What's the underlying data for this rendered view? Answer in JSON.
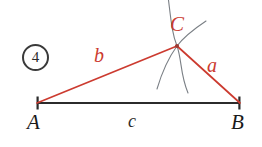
{
  "figure": {
    "badge": {
      "label": "4"
    },
    "vertices": [
      {
        "id": "A",
        "label": "A",
        "color": "#1a1a1a",
        "x": 37,
        "y": 103,
        "label_x": 27,
        "label_y": 112
      },
      {
        "id": "B",
        "label": "B",
        "color": "#1a1a1a",
        "x": 240,
        "y": 103,
        "label_x": 231,
        "label_y": 112
      },
      {
        "id": "C",
        "label": "C",
        "color": "#cc3b30",
        "x": 177,
        "y": 46,
        "label_x": 170,
        "label_y": 14
      }
    ],
    "sides": [
      {
        "id": "a",
        "label": "a",
        "from": "C",
        "to": "B",
        "color": "#cc3b30",
        "label_x": 207,
        "label_y": 55
      },
      {
        "id": "b",
        "label": "b",
        "from": "A",
        "to": "C",
        "color": "#cc3b30",
        "label_x": 94,
        "label_y": 45
      },
      {
        "id": "c",
        "label": "c",
        "from": "A",
        "to": "B",
        "color": "#2b2b2b",
        "label_x": 128,
        "label_y": 112
      }
    ],
    "construction_arcs": [
      {
        "id": "arc-from-A",
        "color": "#7a7f85",
        "path": "M 168 -4 C 171 20 172 34 177 46 C 182 60 180 74 188 93"
      },
      {
        "id": "arc-from-B",
        "color": "#7a7f85",
        "path": "M 206 21 C 194 29 183 38 177 46 C 169 57 162 72 157 89"
      }
    ],
    "colors": {
      "red_accent": "#cc3b30",
      "baseline": "#2b2b2b",
      "arc_gray": "#7a7f85",
      "background": "#ffffff"
    }
  }
}
